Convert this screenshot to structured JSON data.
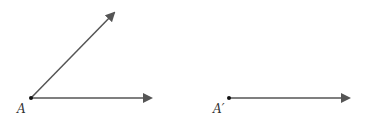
{
  "diagram": {
    "stroke_color": "#555555",
    "point_color": "#111111",
    "figures": [
      {
        "name": "angle-A",
        "vertex": {
          "label": "A",
          "x": 31,
          "y": 98
        },
        "rays": [
          {
            "to": {
              "x": 116,
              "y": 11
            }
          },
          {
            "to": {
              "x": 153,
              "y": 98
            }
          }
        ]
      },
      {
        "name": "ray-A-prime",
        "vertex": {
          "label": "A′",
          "x": 229,
          "y": 98
        },
        "rays": [
          {
            "to": {
              "x": 351,
              "y": 98
            }
          }
        ]
      }
    ]
  },
  "labels": {
    "A": "A",
    "A_prime": "A′"
  }
}
